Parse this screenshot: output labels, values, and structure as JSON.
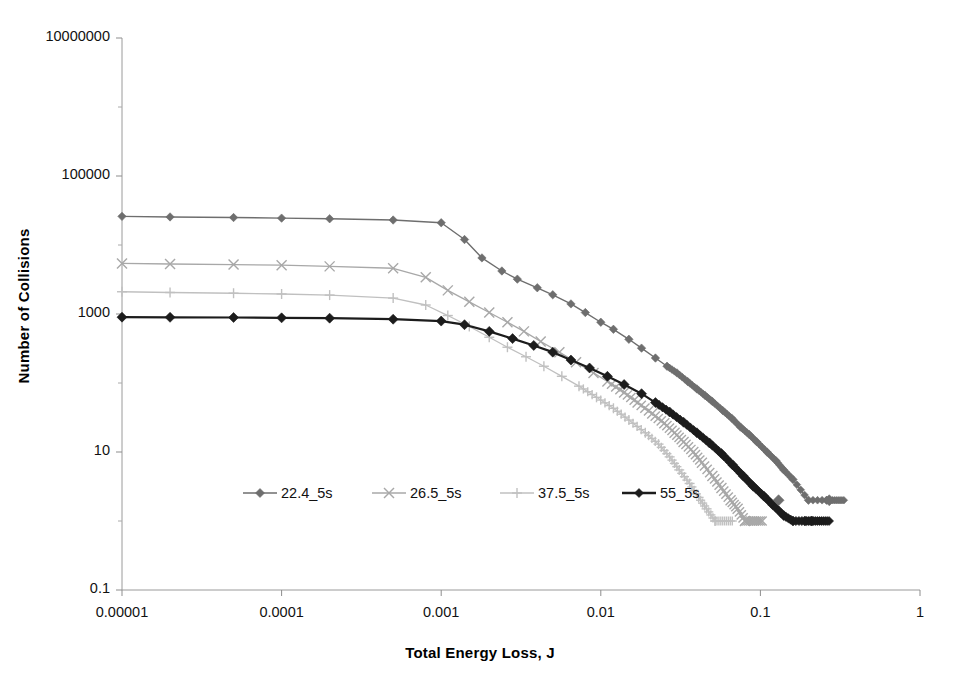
{
  "chart_data": {
    "type": "line",
    "title": "",
    "xlabel": "Total Energy Loss, J",
    "ylabel": "Number of Collisions",
    "xscale": "log",
    "yscale": "log",
    "xlim": [
      1e-05,
      1
    ],
    "ylim": [
      0.1,
      10000000
    ],
    "grid": false,
    "legend_position": "inside-bottom-center",
    "x_ticks": [
      "0.00001",
      "0.0001",
      "0.001",
      "0.01",
      "0.1",
      "1"
    ],
    "x_tick_values": [
      1e-05,
      0.0001,
      0.001,
      0.01,
      0.1,
      1
    ],
    "y_ticks": [
      "0.1",
      "10",
      "1000",
      "100000",
      "10000000"
    ],
    "y_tick_values": [
      0.1,
      10,
      1000,
      100000,
      10000000
    ],
    "series": [
      {
        "name": "22.4_5s",
        "color": "#6e6e6e",
        "marker": "diamond",
        "line_width": 1.4,
        "x": [
          1e-05,
          2e-05,
          5e-05,
          0.0001,
          0.0002,
          0.0005,
          0.001,
          0.0014,
          0.0018,
          0.0024,
          0.003,
          0.004,
          0.005,
          0.0065,
          0.008,
          0.01,
          0.012,
          0.015,
          0.018,
          0.022,
          0.026,
          0.03,
          0.035,
          0.04,
          0.045,
          0.05,
          0.058,
          0.066,
          0.075,
          0.085,
          0.095,
          0.11,
          0.125,
          0.14,
          0.16,
          0.2,
          0.26
        ],
        "y": [
          26000,
          25500,
          25000,
          24500,
          24000,
          23000,
          21000,
          12000,
          6500,
          4200,
          3200,
          2400,
          1900,
          1400,
          1050,
          760,
          600,
          430,
          320,
          230,
          175,
          140,
          105,
          82,
          66,
          54,
          40,
          31,
          23,
          18,
          14,
          10,
          7.5,
          5.5,
          4,
          2,
          2
        ],
        "y_axis_note": "plateau near 25000 then power-law decay to floor of 1"
      },
      {
        "name": "26.5_5s",
        "color": "#a8a8a8",
        "marker": "x",
        "line_width": 1.3,
        "x": [
          1e-05,
          2e-05,
          5e-05,
          0.0001,
          0.0002,
          0.0005,
          0.0008,
          0.0011,
          0.0015,
          0.002,
          0.0026,
          0.0033,
          0.0042,
          0.0055,
          0.007,
          0.009,
          0.011,
          0.014,
          0.017,
          0.021,
          0.025,
          0.029,
          0.033,
          0.038,
          0.043,
          0.05,
          0.057,
          0.065,
          0.072,
          0.08
        ],
        "y": [
          5400,
          5300,
          5200,
          5100,
          4900,
          4600,
          3400,
          2200,
          1500,
          1050,
          760,
          560,
          400,
          280,
          200,
          140,
          105,
          73,
          52,
          36,
          26,
          19,
          14,
          10,
          7,
          4.5,
          3,
          2,
          1.5,
          1
        ]
      },
      {
        "name": "37.5_5s",
        "color": "#c0c0c0",
        "marker": "plus",
        "line_width": 1.3,
        "x": [
          1e-05,
          2e-05,
          5e-05,
          0.0001,
          0.0002,
          0.0005,
          0.0008,
          0.0011,
          0.0015,
          0.002,
          0.0026,
          0.0034,
          0.0044,
          0.0057,
          0.0073,
          0.0094,
          0.012,
          0.015,
          0.019,
          0.023,
          0.027,
          0.031,
          0.036,
          0.041,
          0.046,
          0.052
        ],
        "y": [
          2100,
          2050,
          2000,
          1950,
          1880,
          1700,
          1350,
          950,
          660,
          460,
          330,
          240,
          175,
          125,
          90,
          62,
          43,
          29,
          19,
          13,
          8.5,
          5.5,
          3.5,
          2.2,
          1.5,
          1
        ]
      },
      {
        "name": "55_5s",
        "color": "#1c1c1c",
        "marker": "diamond",
        "line_width": 2.2,
        "x": [
          1e-05,
          2e-05,
          5e-05,
          0.0001,
          0.0002,
          0.0005,
          0.001,
          0.0014,
          0.002,
          0.0028,
          0.0038,
          0.005,
          0.0065,
          0.0085,
          0.011,
          0.014,
          0.018,
          0.022,
          0.027,
          0.033,
          0.04,
          0.048,
          0.057,
          0.067,
          0.078,
          0.09,
          0.105,
          0.12,
          0.14,
          0.16,
          0.19,
          0.21
        ],
        "y": [
          900,
          895,
          890,
          880,
          870,
          840,
          790,
          700,
          560,
          440,
          350,
          280,
          215,
          165,
          125,
          95,
          70,
          52,
          38,
          27,
          19,
          13.5,
          9.5,
          6.5,
          4.5,
          3.2,
          2.3,
          1.7,
          1.2,
          1,
          1,
          1
        ]
      }
    ],
    "scatter_outliers": [
      {
        "series": "22.4_5s",
        "x": 0.13,
        "y": 2
      },
      {
        "series": "22.4_5s",
        "x": 0.27,
        "y": 2
      }
    ]
  },
  "axes": {
    "x_title": "Total Energy Loss, J",
    "y_title": "Number of Collisions"
  },
  "legend": {
    "items": [
      {
        "label": "22.4_5s",
        "color": "#6e6e6e",
        "marker": "diamond"
      },
      {
        "label": "26.5_5s",
        "color": "#a8a8a8",
        "marker": "x"
      },
      {
        "label": "37.5_5s",
        "color": "#c0c0c0",
        "marker": "plus"
      },
      {
        "label": "55_5s",
        "color": "#1c1c1c",
        "marker": "diamond"
      }
    ]
  }
}
